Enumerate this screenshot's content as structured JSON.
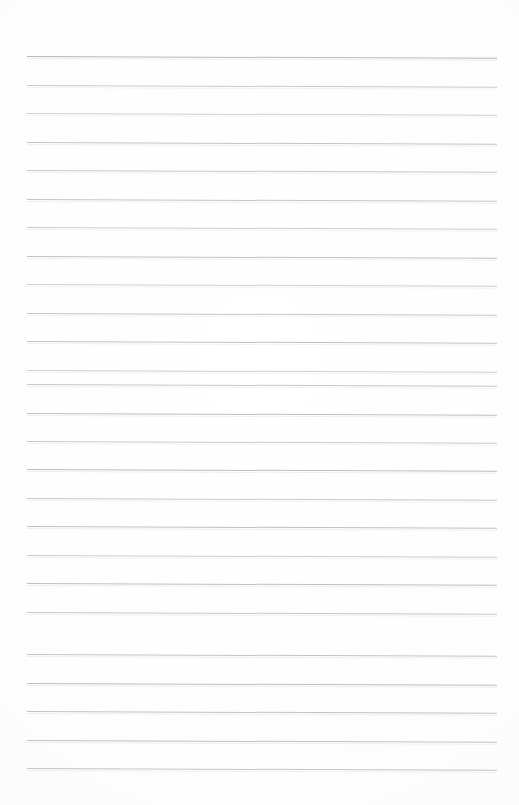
{
  "document": {
    "kind": "scanned-blank-ruled-notebook-page",
    "title": "",
    "visible_text": "",
    "page_width": 519,
    "page_height": 805,
    "background_color": "#fdfdfd",
    "rule_color": "#b6b6ba",
    "content": {
      "has_text": false,
      "has_images": false,
      "has_handwriting": false,
      "note": ""
    },
    "ruling": {
      "line_count": 26,
      "first_line_y": 56,
      "last_line_y": 768,
      "spacing_px": 28.5,
      "left_x": 27,
      "right_x": 497,
      "line_length_px": 470,
      "tilt_deg": 0.22,
      "lines": [
        {
          "index": 1,
          "y": 56,
          "opacity": 0.98,
          "thickness": 1.15
        },
        {
          "index": 2,
          "y": 85,
          "opacity": 0.72,
          "thickness": 1.0
        },
        {
          "index": 3,
          "y": 113,
          "opacity": 0.66,
          "thickness": 1.0
        },
        {
          "index": 4,
          "y": 142,
          "opacity": 0.82,
          "thickness": 1.0
        },
        {
          "index": 5,
          "y": 170,
          "opacity": 0.74,
          "thickness": 1.0
        },
        {
          "index": 6,
          "y": 199,
          "opacity": 0.8,
          "thickness": 1.0
        },
        {
          "index": 7,
          "y": 227,
          "opacity": 0.7,
          "thickness": 1.0
        },
        {
          "index": 8,
          "y": 256,
          "opacity": 0.86,
          "thickness": 1.0
        },
        {
          "index": 9,
          "y": 284,
          "opacity": 0.64,
          "thickness": 1.0
        },
        {
          "index": 10,
          "y": 313,
          "opacity": 0.78,
          "thickness": 1.0
        },
        {
          "index": 11,
          "y": 341,
          "opacity": 0.84,
          "thickness": 1.0
        },
        {
          "index": 12,
          "y": 370,
          "opacity": 0.68,
          "thickness": 1.0
        },
        {
          "index": 13,
          "y": 384,
          "opacity": 0.76,
          "thickness": 1.0
        },
        {
          "index": 14,
          "y": 413,
          "opacity": 0.88,
          "thickness": 1.05
        },
        {
          "index": 15,
          "y": 441,
          "opacity": 0.72,
          "thickness": 1.0
        },
        {
          "index": 16,
          "y": 469,
          "opacity": 0.9,
          "thickness": 1.05
        },
        {
          "index": 17,
          "y": 498,
          "opacity": 0.74,
          "thickness": 1.0
        },
        {
          "index": 18,
          "y": 526,
          "opacity": 0.86,
          "thickness": 1.0
        },
        {
          "index": 19,
          "y": 555,
          "opacity": 0.7,
          "thickness": 1.0
        },
        {
          "index": 20,
          "y": 583,
          "opacity": 0.88,
          "thickness": 1.05
        },
        {
          "index": 21,
          "y": 612,
          "opacity": 0.76,
          "thickness": 1.0
        },
        {
          "index": 22,
          "y": 654,
          "opacity": 0.82,
          "thickness": 1.0
        },
        {
          "index": 23,
          "y": 683,
          "opacity": 0.9,
          "thickness": 1.05
        },
        {
          "index": 24,
          "y": 711,
          "opacity": 0.84,
          "thickness": 1.0
        },
        {
          "index": 25,
          "y": 740,
          "opacity": 0.86,
          "thickness": 1.05
        },
        {
          "index": 26,
          "y": 768,
          "opacity": 0.8,
          "thickness": 1.0
        }
      ]
    },
    "margins": {
      "top_px": 56,
      "bottom_px": 37,
      "left_px": 27,
      "right_px": 22,
      "vertical_margin_rule": false
    }
  }
}
